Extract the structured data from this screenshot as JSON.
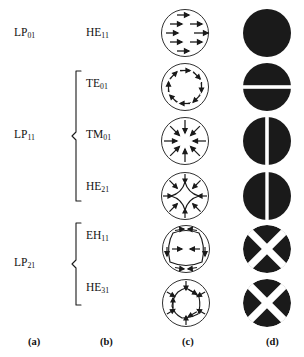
{
  "figure": {
    "stroke_color": "#1a1a1a",
    "fill_color": "#1a1a1a",
    "background": "#ffffff"
  },
  "columns": [
    {
      "key": "a",
      "footer": "(a)",
      "caption_x": 28,
      "name": "column-lp-modes"
    },
    {
      "key": "b",
      "footer": "(b)",
      "caption_x": 100,
      "name": "column-vector-modes"
    },
    {
      "key": "c",
      "footer": "(c)",
      "caption_x": 182,
      "name": "column-field-patterns"
    },
    {
      "key": "d",
      "footer": "(d)",
      "caption_x": 266,
      "name": "column-intensity-patterns"
    }
  ],
  "lp_modes": [
    {
      "label": "LP",
      "sub": "01",
      "y": 33,
      "name": "lp01"
    },
    {
      "label": "LP",
      "sub": "11",
      "y": 135,
      "name": "lp11"
    },
    {
      "label": "LP",
      "sub": "21",
      "y": 263,
      "name": "lp21"
    }
  ],
  "vector_modes": [
    {
      "label": "HE",
      "sub": "11",
      "y": 33,
      "row": 0,
      "field": "linear-uniform",
      "intensity": "solid-disk",
      "name": "he11"
    },
    {
      "label": "TE",
      "sub": "01",
      "y": 84,
      "row": 1,
      "field": "azimuthal",
      "intensity": "horizontal-split",
      "name": "te01"
    },
    {
      "label": "TM",
      "sub": "01",
      "y": 135,
      "row": 2,
      "field": "radial-inward",
      "intensity": "vertical-split",
      "name": "tm01"
    },
    {
      "label": "HE",
      "sub": "21",
      "y": 187,
      "row": 3,
      "field": "astroid-four-lobe",
      "intensity": "vertical-split",
      "name": "he21"
    },
    {
      "label": "EH",
      "sub": "11",
      "y": 236,
      "row": 4,
      "field": "rounded-square",
      "intensity": "four-quadrant-x",
      "name": "eh11"
    },
    {
      "label": "HE",
      "sub": "31",
      "y": 288,
      "row": 5,
      "field": "hexagonal-six-lobe",
      "intensity": "four-quadrant-x",
      "name": "he31"
    }
  ],
  "braces": [
    {
      "name": "brace-lp11",
      "top": 73,
      "bottom": 198,
      "mid": 135,
      "spans": [
        "TE01",
        "TM01",
        "HE21"
      ]
    },
    {
      "name": "brace-lp21",
      "top": 225,
      "bottom": 300,
      "mid": 263,
      "spans": [
        "EH11",
        "HE31"
      ]
    }
  ],
  "geometry": {
    "field_center_x": 185,
    "intensity_center_x": 267,
    "circle_radius": 24,
    "row_centers": [
      33,
      87,
      141,
      196,
      249,
      303
    ]
  }
}
